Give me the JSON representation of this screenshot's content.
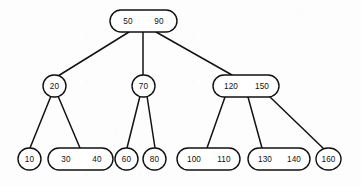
{
  "diagram": {
    "type": "b-tree",
    "canvas": {
      "width": 361,
      "height": 186,
      "background": "#fdfdfd"
    },
    "style": {
      "node_fill": "#ffffff",
      "node_stroke": "#101010",
      "edge_stroke": "#131313",
      "text_color": "#111111"
    },
    "levels": 3,
    "nodes": [
      {
        "id": "root",
        "level": 0,
        "keys": [
          "50",
          "90"
        ],
        "key_labels": {
          "k0": "50",
          "k1": "90"
        },
        "box": {
          "x": 110,
          "y": 10,
          "w": 67,
          "h": 22,
          "rx": 11
        },
        "key_x": [
          128,
          159
        ],
        "center_y": 21
      },
      {
        "id": "n20",
        "level": 1,
        "keys": [
          "20"
        ],
        "key_labels": {
          "k0": "20"
        },
        "box": {
          "x": 43,
          "y": 75,
          "w": 23,
          "h": 22,
          "rx": 11
        },
        "key_x": [
          54.5
        ],
        "center_y": 86
      },
      {
        "id": "n70",
        "level": 1,
        "keys": [
          "70"
        ],
        "key_labels": {
          "k0": "70"
        },
        "box": {
          "x": 132,
          "y": 75,
          "w": 23,
          "h": 22,
          "rx": 11
        },
        "key_x": [
          143.5
        ],
        "center_y": 86
      },
      {
        "id": "n120_150",
        "level": 1,
        "keys": [
          "120",
          "150"
        ],
        "key_labels": {
          "k0": "120",
          "k1": "150"
        },
        "box": {
          "x": 213,
          "y": 75,
          "w": 66,
          "h": 22,
          "rx": 11
        },
        "key_x": [
          231,
          262
        ],
        "center_y": 86
      },
      {
        "id": "n10",
        "level": 2,
        "keys": [
          "10"
        ],
        "key_labels": {
          "k0": "10"
        },
        "box": {
          "x": 18,
          "y": 148,
          "w": 23,
          "h": 22,
          "rx": 11
        },
        "key_x": [
          29.5
        ],
        "center_y": 159
      },
      {
        "id": "n30_40",
        "level": 2,
        "keys": [
          "30",
          "40"
        ],
        "key_labels": {
          "k0": "30",
          "k1": "40"
        },
        "box": {
          "x": 48,
          "y": 148,
          "w": 65,
          "h": 22,
          "rx": 11
        },
        "key_x": [
          66,
          97
        ],
        "center_y": 159
      },
      {
        "id": "n60",
        "level": 2,
        "keys": [
          "60"
        ],
        "key_labels": {
          "k0": "60"
        },
        "box": {
          "x": 115,
          "y": 148,
          "w": 23,
          "h": 22,
          "rx": 11
        },
        "key_x": [
          126.5
        ],
        "center_y": 159
      },
      {
        "id": "n80",
        "level": 2,
        "keys": [
          "80"
        ],
        "key_labels": {
          "k0": "80"
        },
        "box": {
          "x": 143,
          "y": 148,
          "w": 23,
          "h": 22,
          "rx": 11
        },
        "key_x": [
          154.5
        ],
        "center_y": 159
      },
      {
        "id": "n100_110",
        "level": 2,
        "keys": [
          "100",
          "110"
        ],
        "key_labels": {
          "k0": "100",
          "k1": "110"
        },
        "box": {
          "x": 177,
          "y": 148,
          "w": 63,
          "h": 22,
          "rx": 11
        },
        "key_x": [
          194,
          224
        ],
        "center_y": 159
      },
      {
        "id": "n130_140",
        "level": 2,
        "keys": [
          "130",
          "140"
        ],
        "key_labels": {
          "k0": "130",
          "k1": "140"
        },
        "box": {
          "x": 248,
          "y": 148,
          "w": 62,
          "h": 22,
          "rx": 11
        },
        "key_x": [
          265,
          294
        ],
        "center_y": 159
      },
      {
        "id": "n160",
        "level": 2,
        "keys": [
          "160"
        ],
        "key_labels": {
          "k0": "160"
        },
        "box": {
          "x": 316,
          "y": 148,
          "w": 25,
          "h": 22,
          "rx": 12
        },
        "key_x": [
          328.5
        ],
        "center_y": 159
      }
    ],
    "edges": [
      {
        "id": "e-root-20",
        "from": "root",
        "to": "n20",
        "x1": 129,
        "y1": 32,
        "x2": 58,
        "y2": 76
      },
      {
        "id": "e-root-70",
        "from": "root",
        "to": "n70",
        "x1": 143,
        "y1": 32,
        "x2": 143,
        "y2": 75
      },
      {
        "id": "e-root-120",
        "from": "root",
        "to": "n120_150",
        "x1": 156,
        "y1": 32,
        "x2": 232,
        "y2": 75
      },
      {
        "id": "e-20-10",
        "from": "n20",
        "to": "n10",
        "x1": 51,
        "y1": 96,
        "x2": 30,
        "y2": 148
      },
      {
        "id": "e-20-30",
        "from": "n20",
        "to": "n30_40",
        "x1": 58,
        "y1": 96,
        "x2": 80,
        "y2": 148
      },
      {
        "id": "e-70-60",
        "from": "n70",
        "to": "n60",
        "x1": 140,
        "y1": 96,
        "x2": 127,
        "y2": 148
      },
      {
        "id": "e-70-80",
        "from": "n70",
        "to": "n80",
        "x1": 147,
        "y1": 96,
        "x2": 155,
        "y2": 148
      },
      {
        "id": "e-120-100",
        "from": "n120_150",
        "to": "n100_110",
        "x1": 225,
        "y1": 97,
        "x2": 207,
        "y2": 148
      },
      {
        "id": "e-120-130",
        "from": "n120_150",
        "to": "n130_140",
        "x1": 248,
        "y1": 97,
        "x2": 262,
        "y2": 148
      },
      {
        "id": "e-120-160",
        "from": "n120_150",
        "to": "n160",
        "x1": 270,
        "y1": 97,
        "x2": 325,
        "y2": 150
      }
    ]
  }
}
